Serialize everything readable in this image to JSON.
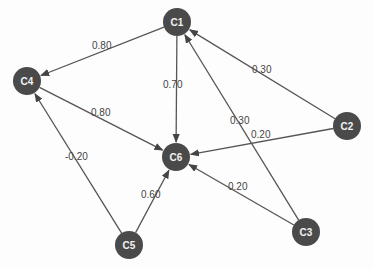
{
  "diagram": {
    "type": "directed-weighted-graph",
    "node_color": "#4a4a4a",
    "edge_color": "#555555",
    "nodes": [
      {
        "id": "C1",
        "label": "C1",
        "x": 177,
        "y": 22
      },
      {
        "id": "C2",
        "label": "C2",
        "x": 347,
        "y": 126
      },
      {
        "id": "C3",
        "label": "C3",
        "x": 306,
        "y": 232
      },
      {
        "id": "C4",
        "label": "C4",
        "x": 27,
        "y": 81
      },
      {
        "id": "C5",
        "label": "C5",
        "x": 129,
        "y": 245
      },
      {
        "id": "C6",
        "label": "C6",
        "x": 176,
        "y": 157
      }
    ],
    "edges": [
      {
        "from": "C1",
        "to": "C4",
        "weight": "0.80",
        "label_x": 92,
        "label_y": 49
      },
      {
        "from": "C1",
        "to": "C6",
        "weight": "0.70",
        "label_x": 163,
        "label_y": 88
      },
      {
        "from": "C2",
        "to": "C1",
        "weight": "0.30",
        "label_x": 252,
        "label_y": 73
      },
      {
        "from": "C3",
        "to": "C1",
        "weight": "0.30",
        "label_x": 230,
        "label_y": 124
      },
      {
        "from": "C4",
        "to": "C6",
        "weight": "0.80",
        "label_x": 91,
        "label_y": 116
      },
      {
        "from": "C2",
        "to": "C6",
        "weight": "0.20",
        "label_x": 251,
        "label_y": 138
      },
      {
        "from": "C5",
        "to": "C4",
        "weight": "-0.20",
        "label_x": 65,
        "label_y": 160
      },
      {
        "from": "C5",
        "to": "C6",
        "weight": "0.60",
        "label_x": 141,
        "label_y": 198
      },
      {
        "from": "C3",
        "to": "C6",
        "weight": "0.20",
        "label_x": 228,
        "label_y": 190
      }
    ]
  }
}
